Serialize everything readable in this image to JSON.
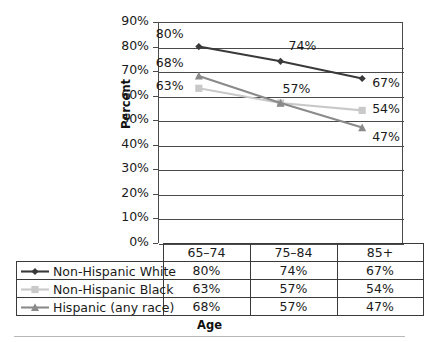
{
  "chart_data": {
    "type": "line",
    "title": "",
    "xlabel": "Age",
    "ylabel": "Percent",
    "categories": [
      "65–74",
      "75–84",
      "85+"
    ],
    "ylim": [
      0,
      90
    ],
    "ytick_labels": [
      "0%",
      "10%",
      "20%",
      "30%",
      "40%",
      "50%",
      "60%",
      "70%",
      "80%",
      "90%"
    ],
    "ytick_values": [
      0,
      10,
      20,
      30,
      40,
      50,
      60,
      70,
      80,
      90
    ],
    "grid": "horizontal",
    "legend_position": "bottom-table",
    "series": [
      {
        "name": "Non-Hispanic White",
        "values": [
          80,
          74,
          67
        ],
        "labels": [
          "80%",
          "74%",
          "67%"
        ],
        "color": "#3a3a3a",
        "marker": "diamond"
      },
      {
        "name": "Non-Hispanic Black",
        "values": [
          63,
          57,
          54
        ],
        "labels": [
          "63%",
          "57%",
          "54%"
        ],
        "color": "#c9c9c9",
        "marker": "square"
      },
      {
        "name": "Hispanic (any race)",
        "values": [
          68,
          57,
          47
        ],
        "labels": [
          "68%",
          "57%",
          "47%"
        ],
        "color": "#8a8a8a",
        "marker": "triangle"
      }
    ]
  },
  "table": {
    "header": [
      "",
      "65–74",
      "75–84",
      "85+"
    ],
    "rows": [
      {
        "label": "Non-Hispanic White",
        "cells": [
          "80%",
          "74%",
          "67%"
        ]
      },
      {
        "label": "Non-Hispanic Black",
        "cells": [
          "63%",
          "57%",
          "54%"
        ]
      },
      {
        "label": "Hispanic (any race)",
        "cells": [
          "68%",
          "57%",
          "47%"
        ]
      }
    ]
  }
}
